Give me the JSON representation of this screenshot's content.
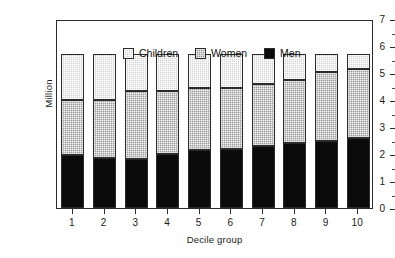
{
  "chart_data": {
    "type": "bar",
    "subtype": "stacked-vertical",
    "title": "",
    "xlabel": "Decile group",
    "ylabel": "Million",
    "categories": [
      "1",
      "2",
      "3",
      "4",
      "5",
      "6",
      "7",
      "8",
      "9",
      "10"
    ],
    "series": [
      {
        "name": "Men",
        "color": "#0b0b0b",
        "values": [
          1.95,
          1.85,
          1.8,
          2.0,
          2.15,
          2.2,
          2.3,
          2.4,
          2.5,
          2.6
        ]
      },
      {
        "name": "Women",
        "color": "#9a9a9a",
        "values": [
          2.05,
          2.15,
          2.53,
          2.35,
          2.3,
          2.25,
          2.3,
          2.35,
          2.55,
          2.55
        ]
      },
      {
        "name": "Children",
        "color": "#d2d2d2",
        "values": [
          1.7,
          1.7,
          1.37,
          1.35,
          1.25,
          1.25,
          1.1,
          0.95,
          0.65,
          0.55
        ]
      }
    ],
    "stack_order": [
      "Men",
      "Women",
      "Children"
    ],
    "totals": [
      5.7,
      5.7,
      5.7,
      5.7,
      5.7,
      5.7,
      5.7,
      5.7,
      5.7,
      5.7
    ],
    "ylim": [
      0,
      7
    ],
    "y_major_ticks": [
      0,
      1,
      2,
      3,
      4,
      5,
      6,
      7
    ],
    "y_minor_ticks": [
      0.5,
      1.5,
      2.5,
      3.5,
      4.5,
      5.5,
      6.5
    ],
    "y_tick_labels": [
      "0",
      "1",
      "2",
      "3",
      "4",
      "5",
      "6",
      "7"
    ],
    "grid": false,
    "legend": {
      "position": "top-left-inside",
      "entries": [
        {
          "label": "Children",
          "swatch": "#d2d2d2"
        },
        {
          "label": "Women",
          "swatch": "#9a9a9a"
        },
        {
          "label": "Men",
          "swatch": "#0b0b0b"
        }
      ]
    }
  }
}
